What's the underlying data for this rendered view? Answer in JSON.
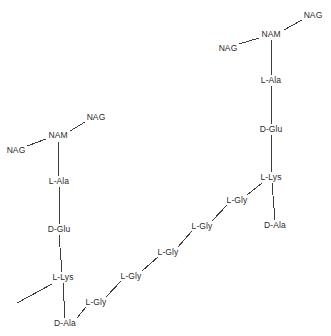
{
  "diagram": {
    "type": "peptidoglycan-chain-diagram",
    "background_color": "#ffffff",
    "bond_color": "#3c3c3c",
    "text_color": "#2b2b2b",
    "nodes": [
      {
        "id": "n1",
        "label": "NAG",
        "x": 313,
        "y": 15,
        "group": "upper-glycan"
      },
      {
        "id": "n2",
        "label": "NAM",
        "x": 271,
        "y": 34,
        "group": "upper-glycan"
      },
      {
        "id": "n3",
        "label": "NAG",
        "x": 228,
        "y": 48,
        "group": "upper-glycan"
      },
      {
        "id": "n4",
        "label": "L-Ala",
        "x": 271,
        "y": 80,
        "group": "upper-stem"
      },
      {
        "id": "n5",
        "label": "D-Glu",
        "x": 271,
        "y": 129,
        "group": "upper-stem"
      },
      {
        "id": "n6",
        "label": "L-Lys",
        "x": 271,
        "y": 177,
        "group": "upper-stem"
      },
      {
        "id": "n7",
        "label": "D-Ala",
        "x": 275,
        "y": 225,
        "group": "upper-stem"
      },
      {
        "id": "n8",
        "label": "L-Gly",
        "x": 237,
        "y": 200,
        "group": "glycine-bridge"
      },
      {
        "id": "n9",
        "label": "L-Gly",
        "x": 202,
        "y": 226,
        "group": "glycine-bridge"
      },
      {
        "id": "n10",
        "label": "L-Gly",
        "x": 168,
        "y": 252,
        "group": "glycine-bridge"
      },
      {
        "id": "n11",
        "label": "L-Gly",
        "x": 131,
        "y": 276,
        "group": "glycine-bridge"
      },
      {
        "id": "n12",
        "label": "L-Gly",
        "x": 96,
        "y": 302,
        "group": "glycine-bridge"
      },
      {
        "id": "n13",
        "label": "NAG",
        "x": 96,
        "y": 117,
        "group": "lower-glycan"
      },
      {
        "id": "n14",
        "label": "NAM",
        "x": 58,
        "y": 135,
        "group": "lower-glycan"
      },
      {
        "id": "n15",
        "label": "NAG",
        "x": 16,
        "y": 150,
        "group": "lower-glycan"
      },
      {
        "id": "n16",
        "label": "L-Ala",
        "x": 59,
        "y": 181,
        "group": "lower-stem"
      },
      {
        "id": "n17",
        "label": "D-Glu",
        "x": 59,
        "y": 229,
        "group": "lower-stem"
      },
      {
        "id": "n18",
        "label": "L-Lys",
        "x": 63,
        "y": 277,
        "group": "lower-stem"
      },
      {
        "id": "n19",
        "label": "D-Ala",
        "x": 65,
        "y": 323,
        "group": "lower-stem"
      }
    ],
    "bonds": [
      {
        "from": "n2",
        "to": "n1",
        "x1": 284,
        "y1": 30,
        "x2": 302,
        "y2": 20
      },
      {
        "from": "n3",
        "to": "n2",
        "x1": 239,
        "y1": 44,
        "x2": 259,
        "y2": 38
      },
      {
        "from": "n2",
        "to": "n4",
        "x1": 271,
        "y1": 40,
        "x2": 271,
        "y2": 75
      },
      {
        "from": "n4",
        "to": "n5",
        "x1": 271,
        "y1": 86,
        "x2": 271,
        "y2": 124
      },
      {
        "from": "n5",
        "to": "n6",
        "x1": 271,
        "y1": 135,
        "x2": 271,
        "y2": 172
      },
      {
        "from": "n6",
        "to": "n7",
        "x1": 272,
        "y1": 183,
        "x2": 275,
        "y2": 220
      },
      {
        "from": "n6",
        "to": "n8",
        "x1": 262,
        "y1": 183,
        "x2": 247,
        "y2": 195
      },
      {
        "from": "n8",
        "to": "n9",
        "x1": 227,
        "y1": 205,
        "x2": 212,
        "y2": 221
      },
      {
        "from": "n9",
        "to": "n10",
        "x1": 192,
        "y1": 231,
        "x2": 178,
        "y2": 247
      },
      {
        "from": "n10",
        "to": "n11",
        "x1": 158,
        "y1": 257,
        "x2": 142,
        "y2": 271
      },
      {
        "from": "n11",
        "to": "n12",
        "x1": 121,
        "y1": 281,
        "x2": 106,
        "y2": 297
      },
      {
        "from": "n12",
        "to": "n19",
        "x1": 86,
        "y1": 307,
        "x2": 77,
        "y2": 318
      },
      {
        "from": "n14",
        "to": "n13",
        "x1": 70,
        "y1": 131,
        "x2": 85,
        "y2": 122
      },
      {
        "from": "n15",
        "to": "n14",
        "x1": 27,
        "y1": 146,
        "x2": 46,
        "y2": 139
      },
      {
        "from": "n14",
        "to": "n16",
        "x1": 58,
        "y1": 141,
        "x2": 59,
        "y2": 176
      },
      {
        "from": "n16",
        "to": "n17",
        "x1": 59,
        "y1": 187,
        "x2": 59,
        "y2": 224
      },
      {
        "from": "n17",
        "to": "n18",
        "x1": 59,
        "y1": 235,
        "x2": 62,
        "y2": 272
      },
      {
        "from": "n18",
        "to": "n19",
        "x1": 63,
        "y1": 283,
        "x2": 65,
        "y2": 318
      },
      {
        "from": "n18",
        "to": "open",
        "x1": 52,
        "y1": 284,
        "x2": 17,
        "y2": 303
      }
    ]
  }
}
